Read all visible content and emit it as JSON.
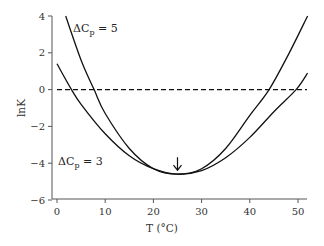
{
  "chart_data": {
    "type": "line",
    "title": "",
    "xlabel": "T (°C)",
    "ylabel": "lnK",
    "xlim": [
      0,
      52
    ],
    "ylim": [
      -6,
      4
    ],
    "xticks": [
      0,
      10,
      20,
      30,
      40,
      50
    ],
    "yticks": [
      4,
      2,
      0,
      -2,
      -4,
      -6
    ],
    "xtick_labels": [
      "0",
      "10",
      "20",
      "30",
      "40",
      "50"
    ],
    "ytick_labels": [
      "4",
      "2",
      "0",
      "−2",
      "−4",
      "−6"
    ],
    "grid": false,
    "legend": "inline labels",
    "reference_line": {
      "y": 0,
      "style": "dashed"
    },
    "annotation": {
      "type": "arrow-down",
      "x": 25,
      "y": -4.6,
      "text": "↓"
    },
    "series": [
      {
        "name": "ΔCp = 5",
        "label_main": "ΔC",
        "label_sub": "p",
        "label_rest": " = 5",
        "x": [
          1.8,
          5,
          7.7,
          10,
          15,
          20,
          25,
          30,
          35,
          40,
          44,
          48,
          52
        ],
        "y": [
          4.0,
          1.6,
          0.0,
          -1.3,
          -3.2,
          -4.3,
          -4.6,
          -4.3,
          -3.2,
          -1.4,
          0.0,
          1.9,
          4.0
        ]
      },
      {
        "name": "ΔCp = 3",
        "label_main": "ΔC",
        "label_sub": "p",
        "label_rest": " = 3",
        "x": [
          0,
          3,
          5,
          10,
          15,
          20,
          25,
          30,
          35,
          40,
          45,
          49.6,
          52
        ],
        "y": [
          1.4,
          0.0,
          -0.8,
          -2.4,
          -3.6,
          -4.3,
          -4.6,
          -4.4,
          -3.7,
          -2.6,
          -1.2,
          0.0,
          0.9
        ]
      }
    ]
  }
}
